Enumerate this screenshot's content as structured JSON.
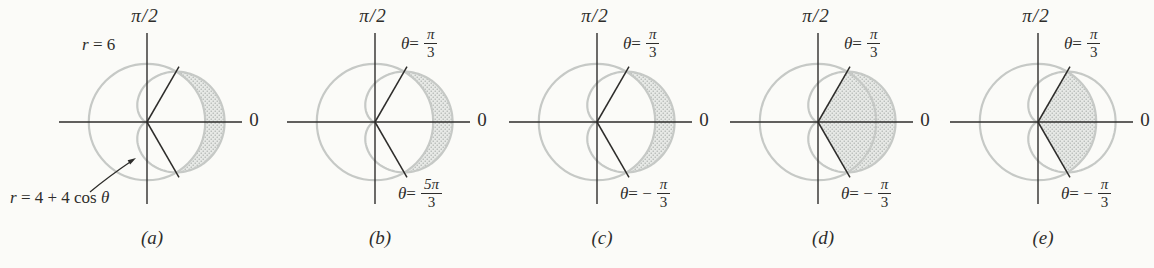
{
  "figure": {
    "colors": {
      "background": "#fbfbf8",
      "curve": "#c6c9c6",
      "axis": "#2e2d2b",
      "shade_bg": "#e7e9e6",
      "shade_dot": "#9fa4a1",
      "text": "#2e2d2b"
    },
    "geometry": {
      "origin_x": 115,
      "origin_y": 122,
      "px_per_unit": 9.7,
      "circle_radius": 6,
      "cardioid_a": 4,
      "cardioid_b": 4,
      "sector_angle_deg": 60,
      "ray_length_px": 64,
      "axis_left": 27,
      "axis_right": 210,
      "axis_top": 33,
      "axis_bottom": 204
    },
    "curves": {
      "circle_equation": "r = 6",
      "cardioid_equation": "r = 4 + 4 cos θ",
      "intersection_angles": [
        "π/3",
        "−π/3 (5π/3)"
      ]
    },
    "panels": [
      {
        "letter": "(a)",
        "polar_axis_label": "π/2",
        "zero_label": "0",
        "circle_label": {
          "var": "r",
          "rest": " = 6"
        },
        "cardioid_label": {
          "var": "r",
          "mid": " = 4 + 4 cos ",
          "end": "θ"
        },
        "shade": "crescent"
      },
      {
        "letter": "(b)",
        "polar_axis_label": "π/2",
        "zero_label": "0",
        "upper_ray": {
          "var": "θ",
          "eq": " = ",
          "num": "π",
          "den": "3"
        },
        "lower_ray": {
          "var": "θ",
          "eq": " = ",
          "num": "5π",
          "den": "3"
        },
        "shade": "crescent"
      },
      {
        "letter": "(c)",
        "polar_axis_label": "π/2",
        "zero_label": "0",
        "upper_ray": {
          "var": "θ",
          "eq": " = ",
          "num": "π",
          "den": "3"
        },
        "lower_ray": {
          "var": "θ",
          "eq": " = −",
          "num": "π",
          "den": "3"
        },
        "shade": "crescent"
      },
      {
        "letter": "(d)",
        "polar_axis_label": "π/2",
        "zero_label": "0",
        "upper_ray": {
          "var": "θ",
          "eq": " = ",
          "num": "π",
          "den": "3"
        },
        "lower_ray": {
          "var": "θ",
          "eq": " = −",
          "num": "π",
          "den": "3"
        },
        "shade": "cardioid_sector"
      },
      {
        "letter": "(e)",
        "polar_axis_label": "π/2",
        "zero_label": "0",
        "upper_ray": {
          "var": "θ",
          "eq": " = ",
          "num": "π",
          "den": "3"
        },
        "lower_ray": {
          "var": "θ",
          "eq": " = −",
          "num": "π",
          "den": "3"
        },
        "shade": "circle_sector"
      }
    ]
  }
}
